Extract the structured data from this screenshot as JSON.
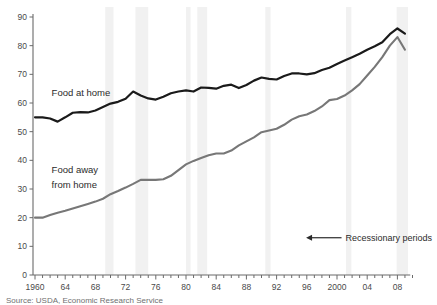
{
  "chart_data": {
    "type": "line",
    "title": "",
    "subtitle": "",
    "xlabel": "",
    "ylabel": "",
    "xlim": [
      1960,
      2009
    ],
    "ylim": [
      0,
      90
    ],
    "yticks": [
      0,
      10,
      20,
      30,
      40,
      50,
      60,
      70,
      80,
      90
    ],
    "ytick_labels": [
      "0",
      "10",
      "20",
      "30",
      "40",
      "50",
      "60",
      "70",
      "80",
      "90"
    ],
    "xticks": [
      1960,
      1964,
      1968,
      1972,
      1976,
      1980,
      1984,
      1988,
      1992,
      1996,
      2000,
      2004,
      2008
    ],
    "xtick_labels": [
      "1960",
      "64",
      "68",
      "72",
      "76",
      "80",
      "84",
      "88",
      "92",
      "96",
      "2000",
      "04",
      "08"
    ],
    "xtick_minor_step": 1,
    "grid": false,
    "legend_position": "inline-labels",
    "x": [
      1960,
      1961,
      1962,
      1963,
      1964,
      1965,
      1966,
      1967,
      1968,
      1969,
      1970,
      1971,
      1972,
      1973,
      1974,
      1975,
      1976,
      1977,
      1978,
      1979,
      1980,
      1981,
      1982,
      1983,
      1984,
      1985,
      1986,
      1987,
      1988,
      1989,
      1990,
      1991,
      1992,
      1993,
      1994,
      1995,
      1996,
      1997,
      1998,
      1999,
      2000,
      2001,
      2002,
      2003,
      2004,
      2005,
      2006,
      2007,
      2008,
      2009
    ],
    "series": [
      {
        "name": "Food at home",
        "color": "#1a1a1a",
        "label_x": 1962.2,
        "label_y": 62.5,
        "values": [
          55.0,
          55.0,
          54.6,
          53.5,
          55.0,
          56.6,
          56.8,
          56.7,
          57.4,
          58.6,
          59.8,
          60.4,
          61.5,
          64.0,
          62.6,
          61.6,
          61.2,
          62.2,
          63.4,
          64.0,
          64.4,
          64.0,
          65.4,
          65.3,
          65.0,
          66.0,
          66.4,
          65.2,
          66.3,
          67.8,
          68.9,
          68.4,
          68.2,
          69.4,
          70.3,
          70.3,
          70.0,
          70.4,
          71.5,
          72.3,
          73.6,
          74.8,
          76.0,
          77.2,
          78.6,
          79.8,
          81.2,
          84.0,
          86.0,
          84.2
        ]
      },
      {
        "name": "Food away from home",
        "color": "#777777",
        "label_x": 1962.2,
        "label_y": 35.5,
        "label_line2_y": 30.5,
        "values": [
          20.0,
          20.0,
          20.9,
          21.7,
          22.4,
          23.2,
          24.0,
          24.8,
          25.6,
          26.6,
          28.2,
          29.3,
          30.5,
          31.8,
          33.2,
          33.2,
          33.2,
          33.4,
          34.6,
          36.6,
          38.6,
          39.8,
          40.8,
          41.8,
          42.4,
          42.4,
          43.4,
          45.2,
          46.6,
          48.0,
          49.8,
          50.4,
          51.0,
          52.4,
          54.2,
          55.4,
          56.0,
          57.2,
          58.8,
          61.0,
          61.4,
          62.6,
          64.4,
          66.6,
          69.6,
          72.6,
          76.0,
          80.0,
          83.0,
          78.6
        ]
      }
    ],
    "recession_bands": [
      {
        "start": 1969.3,
        "end": 1970.4
      },
      {
        "start": 1973.3,
        "end": 1975.0
      },
      {
        "start": 1980.0,
        "end": 1980.6
      },
      {
        "start": 1981.5,
        "end": 1982.8
      },
      {
        "start": 1990.5,
        "end": 1991.2
      },
      {
        "start": 2001.2,
        "end": 2001.9
      },
      {
        "start": 2007.9,
        "end": 2009.4
      }
    ],
    "recession_band_color": "#f1f1f1",
    "annotations": [
      {
        "name": "recessionary-periods",
        "text": "Recessionary periods",
        "arrow": "left",
        "arrow_x_start": 2000.6,
        "arrow_x_end": 1995.9,
        "y": 13.0
      }
    ]
  },
  "axis": {
    "y_labels": [
      "90",
      "80",
      "70",
      "60",
      "50",
      "40",
      "30",
      "20",
      "10",
      "0"
    ],
    "x_labels": [
      "1960",
      "64",
      "68",
      "72",
      "76",
      "80",
      "84",
      "88",
      "92",
      "96",
      "2000",
      "04",
      "08"
    ]
  },
  "labels": {
    "series_food_at_home": "Food at home",
    "series_food_away_line1": "Food away",
    "series_food_away_line2": "from home",
    "annotation_recession": "Recessionary periods"
  },
  "footer": {
    "source": "Source: USDA, Economic Research Service"
  },
  "colors": {
    "food_at_home": "#1a1a1a",
    "food_away_from_home": "#777777",
    "recession_band": "#f1f1f1",
    "axis": "#6a6a6a",
    "background": "#ffffff"
  }
}
